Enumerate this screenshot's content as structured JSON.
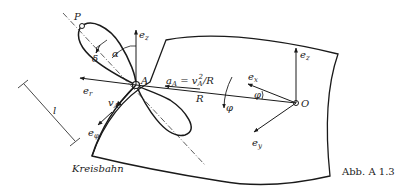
{
  "figure": {
    "caption": "Abb. A 1.3",
    "path_label": "Kreisbahn",
    "points": {
      "P": "P",
      "A": "A",
      "O": "O"
    },
    "vectors": {
      "e_z_left": "e",
      "e_z_left_sub": "z",
      "e_z_right": "e",
      "e_z_right_sub": "z",
      "e_r": "e",
      "e_r_sub": "r",
      "e_phi": "e",
      "e_phi_sub": "φ",
      "e_x": "e",
      "e_x_sub": "x",
      "e_y": "e",
      "e_y_sub": "y",
      "v_A": "v",
      "v_A_sub": "A",
      "delta": "δ"
    },
    "annotations": {
      "acceleration": "a",
      "acceleration_sub": "A",
      "acceleration_eq": " = v",
      "acceleration_eq_sub": "A",
      "acceleration_exp": "2",
      "acceleration_tail": "/R",
      "radius": "R",
      "alpha": "α",
      "phi": "φ",
      "phi_dot": "φ",
      "length": "l"
    }
  }
}
